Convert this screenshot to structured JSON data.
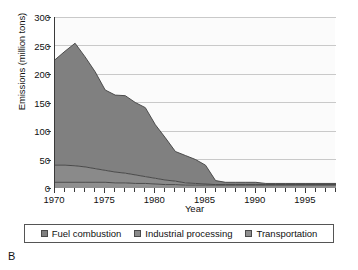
{
  "panel_label": "B",
  "colors": {
    "fuel_combustion": "#808080",
    "industrial_processing": "#8a8a8a",
    "transportation": "#8f8f8f",
    "gridline": "#c9c9c9",
    "axis": "#3a3a3a",
    "plot_background": "#fbfbfb",
    "line": "#3f3f3f"
  },
  "legend": {
    "items": [
      {
        "label": "Fuel combustion",
        "color": "#808080"
      },
      {
        "label": "Industrial processing",
        "color": "#8a8a8a"
      },
      {
        "label": "Transportation",
        "color": "#8f8f8f"
      }
    ]
  },
  "chart_data": {
    "type": "area",
    "stacked": true,
    "title": "",
    "xlabel": "Year",
    "ylabel": "Emissions (million tons)",
    "xlim": [
      1970,
      1998
    ],
    "ylim": [
      0,
      300
    ],
    "ytick_values": [
      0,
      50,
      100,
      150,
      200,
      250,
      300
    ],
    "ytick_labels": [
      "0",
      "50",
      "100",
      "150",
      "200",
      "250",
      "300"
    ],
    "xtick_values": [
      1970,
      1971,
      1972,
      1973,
      1974,
      1975,
      1976,
      1977,
      1978,
      1979,
      1980,
      1981,
      1982,
      1983,
      1984,
      1985,
      1986,
      1987,
      1988,
      1989,
      1990,
      1991,
      1992,
      1993,
      1994,
      1995,
      1996,
      1997,
      1998
    ],
    "xtick_labeled": [
      1970,
      1975,
      1980,
      1985,
      1990,
      1995
    ],
    "xtick_labels": [
      "1970",
      "1975",
      "1980",
      "1985",
      "1990",
      "1995"
    ],
    "grid": {
      "horizontal": true,
      "vertical": false
    },
    "legend_position": "bottom",
    "x": [
      1970,
      1971,
      1972,
      1973,
      1974,
      1975,
      1976,
      1977,
      1978,
      1979,
      1980,
      1981,
      1982,
      1983,
      1984,
      1985,
      1986,
      1987,
      1988,
      1989,
      1990,
      1991,
      1992,
      1993,
      1994,
      1995,
      1996,
      1997,
      1998
    ],
    "series": [
      {
        "name": "Transportation",
        "color": "#8f8f8f",
        "values": [
          10,
          10,
          10,
          10,
          10,
          10,
          9,
          9,
          8,
          8,
          7,
          6,
          6,
          5,
          5,
          5,
          5,
          5,
          5,
          5,
          5,
          5,
          5,
          5,
          5,
          5,
          5,
          5,
          5
        ]
      },
      {
        "name": "Industrial processing",
        "color": "#8a8a8a",
        "values": [
          30,
          30,
          29,
          27,
          24,
          21,
          19,
          17,
          15,
          12,
          10,
          8,
          6,
          4,
          3,
          2,
          1,
          1,
          1,
          1,
          1,
          1,
          1,
          1,
          1,
          1,
          1,
          1,
          1
        ]
      },
      {
        "name": "Fuel combustion",
        "color": "#808080",
        "values": [
          185,
          200,
          215,
          193,
          170,
          141,
          135,
          136,
          127,
          121,
          94,
          74,
          52,
          48,
          42,
          33,
          7,
          4,
          4,
          4,
          4,
          2,
          2,
          2,
          2,
          2,
          2,
          2,
          2
        ]
      }
    ],
    "totals": [
      225,
      240,
      254,
      230,
      204,
      172,
      163,
      162,
      150,
      141,
      111,
      88,
      64,
      57,
      50,
      40,
      13,
      10,
      10,
      10,
      10,
      8,
      8,
      8,
      8,
      8,
      8,
      8,
      8
    ]
  }
}
